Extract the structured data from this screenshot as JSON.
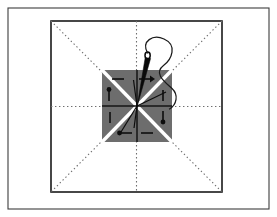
{
  "figure": {
    "domain": "Diagram",
    "title": "",
    "canvas": {
      "width": 277,
      "height": 217,
      "background": "#ffffff"
    },
    "colors": {
      "background": "#ffffff",
      "outer_frame_stroke": "#3c3c3c",
      "inner_square_stroke": "#1a1a1a",
      "dotted_guide_stroke": "#6e6e6e",
      "sector_fill": "#6d6d6d",
      "sector_divider_white": "#ffffff",
      "sector_divider_black": "#141414",
      "marker_stroke": "#0d0d0d",
      "needle_stroke": "#0a0a0a",
      "thread_stroke": "#1a1a1a"
    },
    "outer_frame": {
      "x": 8,
      "y": 8,
      "width": 261,
      "height": 201,
      "stroke_width": 1.1
    },
    "inner_square": {
      "x": 51,
      "y": 21,
      "width": 171,
      "height": 171,
      "stroke_width": 1.6
    },
    "guides": {
      "style": "dotted",
      "dash": "1.4 2.6",
      "stroke_width": 1.1,
      "lines": [
        {
          "name": "diagonal-tl-br",
          "x1": 51,
          "y1": 21,
          "x2": 222,
          "y2": 192
        },
        {
          "name": "diagonal-tr-bl",
          "x1": 222,
          "y1": 21,
          "x2": 51,
          "y2": 192
        },
        {
          "name": "vertical-center",
          "x1": 136.5,
          "y1": 21,
          "x2": 136.5,
          "y2": 192
        },
        {
          "name": "horizontal-center",
          "x1": 51,
          "y1": 106.5,
          "x2": 222,
          "y2": 106.5
        }
      ]
    },
    "center_square": {
      "x": 102,
      "y": 70,
      "width": 70,
      "height": 72,
      "center_x": 137,
      "center_y": 106,
      "sector_count": 8,
      "white_diagonal_width": 3.4,
      "black_cross_width": 1.5
    },
    "sector_markers": [
      {
        "id": "marker-n-w",
        "sector": "top-left-upper",
        "shape": "horizontal-bar",
        "x1": 112,
        "y1": 79,
        "x2": 124,
        "y2": 79,
        "head": "none"
      },
      {
        "id": "marker-n-e",
        "sector": "top-right-upper",
        "shape": "arrow-right",
        "x1": 140,
        "y1": 79,
        "x2": 152,
        "y2": 79,
        "head": "right"
      },
      {
        "id": "marker-w-n",
        "sector": "left-upper",
        "shape": "pin-down",
        "x1": 109,
        "y1": 90,
        "x2": 109,
        "y2": 101,
        "head": "dot-top"
      },
      {
        "id": "marker-e-n",
        "sector": "right-upper",
        "shape": "vertical-bar",
        "x1": 163,
        "y1": 90,
        "x2": 163,
        "y2": 101,
        "head": "none"
      },
      {
        "id": "marker-w-s",
        "sector": "left-lower",
        "shape": "vertical-bar",
        "x1": 110,
        "y1": 112,
        "x2": 110,
        "y2": 123,
        "head": "none"
      },
      {
        "id": "marker-e-s",
        "sector": "right-lower",
        "shape": "pin-down",
        "x1": 163,
        "y1": 111,
        "x2": 163,
        "y2": 122,
        "head": "dot-bottom"
      },
      {
        "id": "marker-s-w",
        "sector": "bottom-left-lower",
        "shape": "pin-elbow",
        "x1": 120,
        "y1": 133,
        "x2": 132,
        "y2": 133,
        "head": "dot-left"
      },
      {
        "id": "marker-s-e",
        "sector": "bottom-right-lower",
        "shape": "horizontal-bar",
        "x1": 141,
        "y1": 133,
        "x2": 153,
        "y2": 133,
        "head": "none"
      }
    ],
    "center_spokes": [
      {
        "id": "spoke-up-left",
        "x1": 137,
        "y1": 106,
        "x2": 134,
        "y2": 80
      },
      {
        "id": "spoke-down",
        "x1": 137,
        "y1": 106,
        "x2": 134,
        "y2": 128
      },
      {
        "id": "spoke-down-left",
        "x1": 137,
        "y1": 106,
        "x2": 121,
        "y2": 133
      },
      {
        "id": "spoke-right",
        "x1": 137,
        "y1": 106,
        "x2": 166,
        "y2": 92
      }
    ],
    "needle": {
      "name": "sewing-needle",
      "tip_x": 137,
      "tip_y": 106,
      "eye_x": 148,
      "eye_y": 56,
      "width_at_eye": 3.2
    },
    "thread": {
      "name": "curving-thread",
      "path": "M148,57 C140,44 152,37 163,42 C176,48 171,60 163,66 C152,73 164,82 171,88 C178,94 176,104 170,108"
    }
  }
}
